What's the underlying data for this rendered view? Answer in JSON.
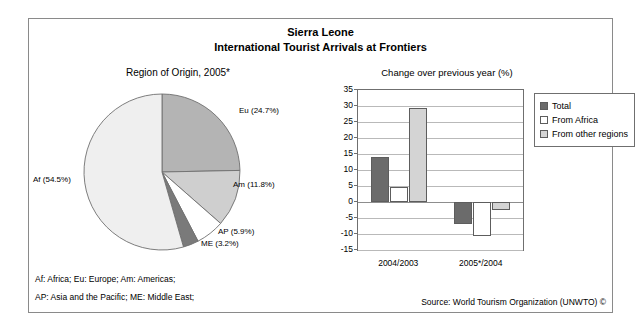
{
  "figure": {
    "title_line1": "Sierra Leone",
    "title_line2": "International Tourist Arrivals at Frontiers",
    "footnote_1": "Af: Africa; Eu: Europe; Am: Americas;",
    "footnote_2": "AP: Asia and the Pacific; ME: Middle East;",
    "source": "Source: World Tourism Organization (UNWTO) ©"
  },
  "colors": {
    "frame": "#8a8a8a",
    "grid": "#b9b9b9",
    "zero_axis": "#8d8d8d",
    "bar_outline": "#5d5d5d",
    "total": "#6b6b6b",
    "from_africa": "#ffffff",
    "from_other_regions": "#d4d4d4",
    "slice_eu": "#b4b4b4",
    "slice_am": "#cfcfcf",
    "slice_ap": "#ffffff",
    "slice_me": "#7a7a7a",
    "slice_af": "#efefef"
  },
  "chart_data": [
    {
      "type": "pie",
      "title": "Region of Origin, 2005*",
      "categories": [
        "Eu",
        "Am",
        "AP",
        "ME",
        "Af"
      ],
      "values": [
        24.7,
        11.8,
        5.9,
        3.2,
        54.5
      ],
      "labels": [
        "Eu (24.7%)",
        "Am (11.8%)",
        "AP (5.9%)",
        "ME (3.2%)",
        "Af (54.5%)"
      ],
      "unit": "%",
      "legend": "none",
      "start_angle_deg": 0,
      "direction": "clockwise",
      "exploded": false,
      "slice_colors": [
        "#b4b4b4",
        "#cfcfcf",
        "#ffffff",
        "#7a7a7a",
        "#efefef"
      ]
    },
    {
      "type": "bar",
      "title": "Change over previous year (%)",
      "categories": [
        "2004/2003",
        "2005*/2004"
      ],
      "series": [
        {
          "name": "Total",
          "values": [
            14.1,
            -7.0
          ],
          "color": "#6b6b6b"
        },
        {
          "name": "From Africa",
          "values": [
            4.6,
            -10.6
          ],
          "color": "#ffffff"
        },
        {
          "name": "From other regions",
          "values": [
            29.4,
            -2.6
          ],
          "color": "#d4d4d4"
        }
      ],
      "xlabel": "",
      "ylabel": "",
      "ylim": [
        -15,
        35
      ],
      "yticks": [
        35,
        30,
        25,
        20,
        15,
        10,
        5,
        0,
        -5,
        -10,
        -15
      ],
      "ytick_labels": [
        "35",
        "30",
        "25",
        "20",
        "15",
        "10",
        "5",
        "0",
        "-5",
        "-10",
        "-15"
      ],
      "grid": true,
      "legend_position": "right",
      "legend_entries": [
        "Total",
        "From Africa",
        "From other regions"
      ]
    }
  ]
}
